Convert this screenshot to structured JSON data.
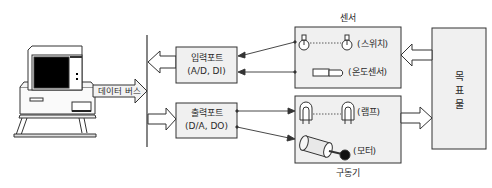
{
  "diagram": {
    "computer": {
      "label": "computer"
    },
    "data_bus": {
      "label": "데이터 버스"
    },
    "input_port": {
      "title": "입력포트",
      "subtitle": "(A/D, DI)"
    },
    "output_port": {
      "title": "출력포트",
      "subtitle": "(D/A, DO)"
    },
    "sensor_group": {
      "caption": "센서",
      "items": [
        {
          "label": "(스위치)"
        },
        {
          "label": "(온도센서)"
        }
      ]
    },
    "actuator_group": {
      "caption": "구동기",
      "items": [
        {
          "label": "(램프)"
        },
        {
          "label": "(모터)"
        }
      ]
    },
    "target": {
      "chars": [
        "목",
        "표",
        "물"
      ]
    },
    "colors": {
      "box_fill": "#f0f0f0",
      "line": "#333333",
      "screen": "#000000"
    }
  }
}
